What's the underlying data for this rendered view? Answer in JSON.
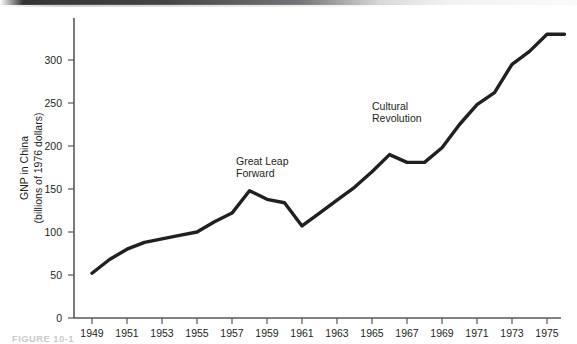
{
  "figure": {
    "caption": "FIGURE 10-1"
  },
  "chart_data": {
    "type": "line",
    "title": "",
    "subtitle": "",
    "xlabel": "",
    "ylabel": "GNP in China\n(billions of 1976 dollars)",
    "ylabel_line1": "GNP in China",
    "ylabel_line2": "(billions of 1976 dollars)",
    "xlim": [
      1948.5,
      1976.2
    ],
    "ylim": [
      0,
      345
    ],
    "grid": false,
    "legend": "none",
    "y_ticks": [
      0,
      50,
      100,
      150,
      200,
      250,
      300
    ],
    "y_tick_labels": [
      "0",
      "50",
      "100",
      "150",
      "200",
      "250",
      "300"
    ],
    "x_ticks": [
      1949,
      1951,
      1953,
      1955,
      1957,
      1959,
      1961,
      1963,
      1965,
      1967,
      1969,
      1971,
      1973,
      1975
    ],
    "x_tick_labels": [
      "1949",
      "1951",
      "1953",
      "1955",
      "1957",
      "1959",
      "1961",
      "1963",
      "1965",
      "1967",
      "1969",
      "1971",
      "1973",
      "1975"
    ],
    "series": [
      {
        "name": "GNP in China",
        "color": "#231f20",
        "x": [
          1949,
          1950,
          1951,
          1952,
          1953,
          1954,
          1955,
          1956,
          1957,
          1958,
          1959,
          1960,
          1961,
          1962,
          1963,
          1964,
          1965,
          1966,
          1967,
          1968,
          1969,
          1970,
          1971,
          1972,
          1973,
          1974,
          1975,
          1976
        ],
        "values": [
          52,
          68,
          80,
          88,
          92,
          96,
          100,
          112,
          122,
          148,
          138,
          134,
          107,
          122,
          137,
          152,
          170,
          190,
          181,
          181,
          198,
          225,
          248,
          262,
          295,
          310,
          330,
          330
        ]
      }
    ],
    "annotations": [
      {
        "id": "great-leap-forward",
        "line1": "Great Leap",
        "line2": "Forward",
        "x": 1957.0,
        "y": 172
      },
      {
        "id": "cultural-revolution",
        "line1": "Cultural",
        "line2": "Revolution",
        "x": 1964.2,
        "y": 248
      }
    ]
  }
}
